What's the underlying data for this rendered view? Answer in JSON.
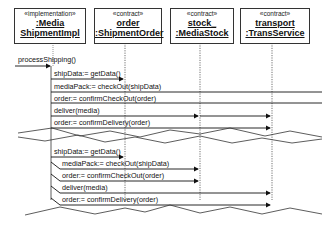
{
  "diagram": {
    "type": "sequence-diagram",
    "participants": [
      {
        "stereotype": "«implementation»",
        "line1": ":Media",
        "line2": "ShipmentImpl"
      },
      {
        "stereotype": "«contract»",
        "line1": "order",
        "line2": ":ShipmentOrder"
      },
      {
        "stereotype": "«contract»",
        "line1": "stock_",
        "line2": ":MediaStock"
      },
      {
        "stereotype": "«contract»",
        "line1": "transport",
        "line2": ":TransService"
      }
    ],
    "entry_message": "processShipping()",
    "fragment_top": {
      "messages": [
        "shipData:= getData()",
        "mediaPack:= checkOut(shipData)",
        "order:= confirmCheckOut(order)",
        "deliver(media)",
        "order:= confirmDelivery(order)"
      ]
    },
    "fragment_bottom": {
      "messages": [
        "shipData:= getData()",
        "mediaPack:= checkOut(shipData)",
        "order:= confirmCheckOut(order)",
        "deliver(media)",
        "order:= confirmDelivery(order)"
      ]
    }
  }
}
